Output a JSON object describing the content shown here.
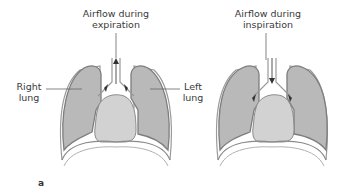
{
  "figure": {
    "panel_label": "a",
    "left_diagram": {
      "title_line1": "Airflow during",
      "title_line2": "expiration",
      "label_right_lung_1": "Right",
      "label_right_lung_2": "lung",
      "label_left_lung_1": "Left",
      "label_left_lung_2": "lung",
      "arrow_direction": "up"
    },
    "right_diagram": {
      "title_line1": "Airflow during",
      "title_line2": "inspiration",
      "arrow_direction": "down"
    },
    "colors": {
      "lung_fill": "#b9b9b9",
      "lung_outline": "#7d7d7d",
      "heart_fill": "#d2d2d2",
      "pleura": "#e8e8e8",
      "text": "#3a3a3a"
    }
  }
}
